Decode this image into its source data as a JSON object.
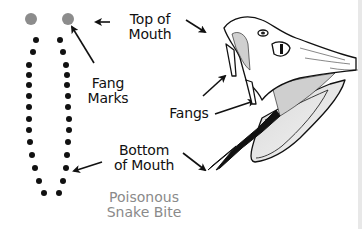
{
  "diagram": {
    "title": "Poisonous\nSnake Bite",
    "labels": {
      "top_of_mouth": "Top of\nMouth",
      "fang_marks": "Fang\nMarks",
      "fangs": "Fangs",
      "bottom_of_mouth": "Bottom\nof Mouth"
    },
    "colors": {
      "fang_mark": "#8c8c8c",
      "tooth_mark": "#111111",
      "title": "#8a8a8a",
      "ink": "#111111"
    },
    "bite_pattern": {
      "fang_marks": [
        [
          31,
          19
        ],
        [
          68,
          19
        ]
      ],
      "left_teeth": [
        [
          36,
          40
        ],
        [
          33,
          52
        ],
        [
          29,
          65
        ],
        [
          29,
          75
        ],
        [
          29,
          85
        ],
        [
          29,
          96
        ],
        [
          29,
          107
        ],
        [
          29,
          119
        ],
        [
          29,
          130
        ],
        [
          30,
          142
        ],
        [
          32,
          155
        ],
        [
          35,
          168
        ],
        [
          39,
          181
        ],
        [
          44,
          193
        ]
      ],
      "right_teeth": [
        [
          60,
          40
        ],
        [
          63,
          52
        ],
        [
          66,
          65
        ],
        [
          67,
          75
        ],
        [
          67,
          85
        ],
        [
          68,
          96
        ],
        [
          68,
          107
        ],
        [
          69,
          119
        ],
        [
          69,
          130
        ],
        [
          68,
          142
        ],
        [
          67,
          155
        ],
        [
          66,
          168
        ],
        [
          63,
          181
        ],
        [
          59,
          193
        ]
      ]
    }
  }
}
